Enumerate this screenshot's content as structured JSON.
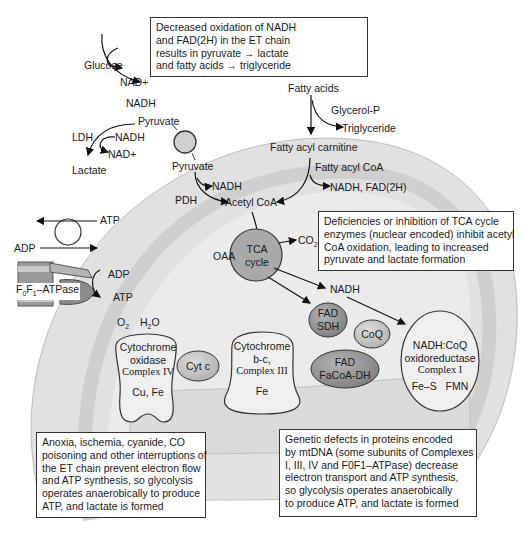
{
  "colors": {
    "outer_compartment": "#e3e3e3",
    "membrane_band": "#d4d4d4",
    "matrix": "#e9e9e9",
    "tca_circle": "#a8a8a8",
    "dark_ellipse": "#8f8f8f",
    "light_ellipse": "#c8c8c8",
    "complex_fill": "#efefef",
    "stroke": "#222222"
  },
  "glycolysis": {
    "glucose": "Glucose",
    "nad_plus": "NAD+",
    "nadh": "NADH",
    "pyruvate": "Pyruvate",
    "ldh": "LDH",
    "ldh_nadh": "NADH",
    "ldh_nad_plus": "NAD+",
    "lactate": "Lactate"
  },
  "fatty_acid": {
    "fatty_acids": "Fatty acids",
    "glycerol_p": "Glycerol-P",
    "triglyceride": "Triglyceride",
    "fatty_acyl_carnitine": "Fatty acyl carnitine",
    "fatty_acyl_coa": "Fatty acyl CoA",
    "nadh_fad2h": "NADH, FAD(2H)"
  },
  "mitochondrion": {
    "pyruvate_inside": "Pyruvate",
    "pdh": "PDH",
    "pdh_nadh": "NADH",
    "acetyl_coa": "Acetyl CoA",
    "oaa": "OAA",
    "tca_line1": "TCA",
    "tca_line2": "cycle",
    "co2": "CO2",
    "tca_nadh": "NADH",
    "atp_out": "ATP",
    "adp_in": "ADP",
    "atpase_label": "F0F1–ATPase",
    "atpase_adp": "ADP",
    "atpase_atp": "ATP",
    "o2": "O2",
    "h2o": "H2O"
  },
  "complexes": {
    "complex_iv": [
      "Cytochrome",
      "oxidase",
      "Complex IV",
      "Cu, Fe"
    ],
    "cyt_c": "Cyt c",
    "complex_iii": [
      "Cytochrome",
      "b-c,",
      "Complex III",
      "Fe"
    ],
    "fad_sdh": [
      "FAD",
      "SDH"
    ],
    "coq": "CoQ",
    "fad_facoa_dh": [
      "FAD",
      "FaCoA-DH"
    ],
    "complex_i": [
      "NADH:CoQ",
      "oxidoreductase",
      "Complex I",
      "Fe–S   FMN"
    ]
  },
  "callouts": {
    "top": {
      "lines": [
        "Decreased oxidation of NADH",
        "and FAD(2H) in the ET chain",
        "results in pyruvate → lactate",
        "and fatty acids → triglyceride"
      ]
    },
    "tca": {
      "lines": [
        "Deficiencies or inhibition of TCA cycle",
        "enzymes (nuclear encoded) inhibit acetyl",
        "CoA oxidation, leading to increased",
        "pyruvate and lactate formation"
      ]
    },
    "anoxia": {
      "lines": [
        "Anoxia, ischemia, cyanide, CO",
        "poisoning and other interruptions of",
        "the ET chain prevent electron flow",
        "and ATP synthesis, so glycolysis",
        "operates anaerobically to produce",
        "ATP, and lactate is formed"
      ]
    },
    "genetic": {
      "lines": [
        "Genetic defects in proteins encoded",
        "by mtDNA (some subunits of Complexes",
        "I, III, IV and F0F1–ATPase) decrease",
        "electron transport and ATP synthesis,",
        "so glycolysis operates anaerobically",
        "to produce ATP, and lactate is formed"
      ]
    }
  }
}
